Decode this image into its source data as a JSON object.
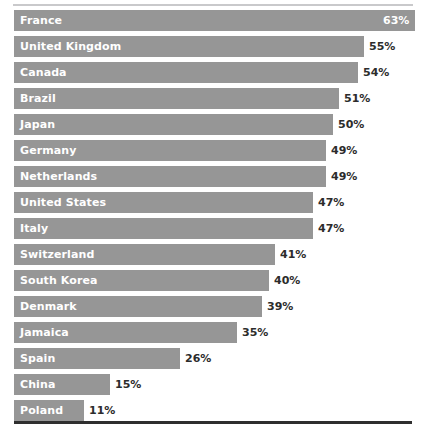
{
  "chart_data": {
    "type": "bar",
    "orientation": "horizontal",
    "title": "",
    "subtitle": "",
    "xlabel": "",
    "ylabel": "",
    "xlim": [
      0,
      63
    ],
    "grid": false,
    "legend": null,
    "value_suffix": "%",
    "categories": [
      "France",
      "United Kingdom",
      "Canada",
      "Brazil",
      "Japan",
      "Germany",
      "Netherlands",
      "United States",
      "Italy",
      "Switzerland",
      "South Korea",
      "Denmark",
      "Jamaica",
      "Spain",
      "China",
      "Poland"
    ],
    "values": [
      63,
      55,
      54,
      51,
      50,
      49,
      49,
      47,
      47,
      41,
      40,
      39,
      35,
      26,
      15,
      11
    ],
    "labels": [
      "63%",
      "55%",
      "54%",
      "51%",
      "50%",
      "49%",
      "49%",
      "47%",
      "47%",
      "41%",
      "40%",
      "39%",
      "35%",
      "26%",
      "15%",
      "11%"
    ],
    "colors": {
      "bar": "#969696",
      "category_label": "#ffffff",
      "value_label": "#2c2c2c",
      "value_label_inside": "#ffffff",
      "rule_top": "#c9c9cb",
      "rule_bottom": "#2f2f2f",
      "background": "#ffffff"
    }
  }
}
